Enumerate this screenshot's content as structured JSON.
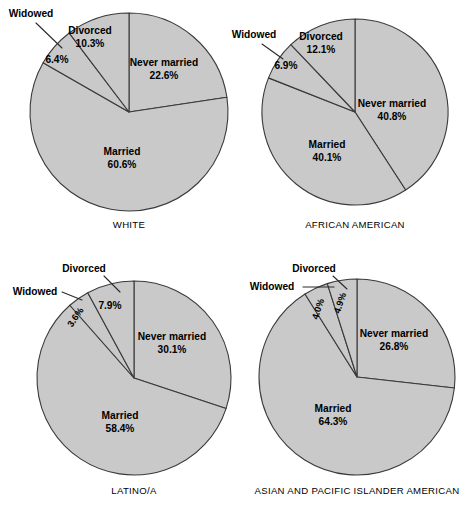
{
  "figure": {
    "background": "#ffffff",
    "slice_fill": "#c9c9c9",
    "slice_stroke": "#3a3a3a",
    "text_color": "#000000"
  },
  "chart_data": [
    {
      "type": "pie",
      "title": "WHITE",
      "categories": [
        "Never married",
        "Married",
        "Widowed",
        "Divorced"
      ],
      "values": [
        22.6,
        60.6,
        6.4,
        10.3
      ],
      "labels": [
        "22.6%",
        "60.6%",
        "6.4%",
        "10.3%"
      ],
      "start_angle_deg": 0,
      "direction": "clockwise",
      "legend": "none",
      "grid": false
    },
    {
      "type": "pie",
      "title": "AFRICAN AMERICAN",
      "categories": [
        "Never married",
        "Married",
        "Widowed",
        "Divorced"
      ],
      "values": [
        40.8,
        40.1,
        6.9,
        12.1
      ],
      "labels": [
        "40.8%",
        "40.1%",
        "6.9%",
        "12.1%"
      ],
      "start_angle_deg": 0,
      "direction": "clockwise",
      "legend": "none",
      "grid": false
    },
    {
      "type": "pie",
      "title": "LATINO/A",
      "categories": [
        "Never married",
        "Married",
        "Widowed",
        "Divorced"
      ],
      "values": [
        30.1,
        58.4,
        3.6,
        7.9
      ],
      "labels": [
        "30.1%",
        "58.4%",
        "3.6%",
        "7.9%"
      ],
      "start_angle_deg": 0,
      "direction": "clockwise",
      "legend": "none",
      "grid": false
    },
    {
      "type": "pie",
      "title": "ASIAN AND PACIFIC ISLANDER AMERICAN",
      "categories": [
        "Never married",
        "Married",
        "Widowed",
        "Divorced"
      ],
      "values": [
        26.8,
        64.3,
        4.0,
        4.9
      ],
      "labels": [
        "26.8%",
        "64.3%",
        "4.0%",
        "4.9%"
      ],
      "start_angle_deg": 0,
      "direction": "clockwise",
      "legend": "none",
      "grid": false
    }
  ],
  "charts": [
    {
      "id": "white",
      "caption": "WHITE",
      "geometry": {
        "cx": 129,
        "cy": 112,
        "r": 99,
        "caption_y": 228
      },
      "slices": [
        {
          "name": "never-married",
          "value": 22.6
        },
        {
          "name": "married",
          "value": 60.6
        },
        {
          "name": "widowed",
          "value": 6.4
        },
        {
          "name": "divorced",
          "value": 10.3
        }
      ],
      "annotations": [
        {
          "name": "never-married-label",
          "line1": "Never married",
          "line2": "22.6%",
          "x": 164,
          "y": 66,
          "anchor": "middle",
          "rotate": 0,
          "size": "lbl"
        },
        {
          "name": "married-label",
          "line1": "Married",
          "line2": "60.6%",
          "x": 122,
          "y": 155,
          "anchor": "middle",
          "rotate": 0,
          "size": "lbl"
        },
        {
          "name": "divorced-label",
          "line1": "Divorced",
          "line2": "10.3%",
          "x": 90,
          "y": 34,
          "anchor": "middle",
          "rotate": 0,
          "size": "lbl"
        },
        {
          "name": "widowed-percent-label",
          "line1": "6.4%",
          "line2": "",
          "x": 57,
          "y": 63,
          "anchor": "middle",
          "rotate": 0,
          "size": "lbl"
        },
        {
          "name": "widowed-label",
          "line1": "Widowed",
          "line2": "",
          "x": 31,
          "y": 17,
          "anchor": "middle",
          "rotate": 0,
          "size": "lbl"
        }
      ],
      "leaders": [
        {
          "name": "widowed-leader",
          "d": "M 36 23 L 62 48"
        }
      ]
    },
    {
      "id": "african-american",
      "caption": "AFRICAN AMERICAN",
      "geometry": {
        "cx": 355,
        "cy": 112,
        "r": 93,
        "caption_y": 228
      },
      "slices": [
        {
          "name": "never-married",
          "value": 40.8
        },
        {
          "name": "married",
          "value": 40.1
        },
        {
          "name": "widowed",
          "value": 6.9
        },
        {
          "name": "divorced",
          "value": 12.1
        }
      ],
      "annotations": [
        {
          "name": "never-married-label",
          "line1": "Never married",
          "line2": "40.8%",
          "x": 392,
          "y": 107,
          "anchor": "middle",
          "rotate": 0,
          "size": "lbl"
        },
        {
          "name": "married-label",
          "line1": "Married",
          "line2": "40.1%",
          "x": 327,
          "y": 148,
          "anchor": "middle",
          "rotate": 0,
          "size": "lbl"
        },
        {
          "name": "divorced-label",
          "line1": "Divorced",
          "line2": "12.1%",
          "x": 321,
          "y": 40,
          "anchor": "middle",
          "rotate": 0,
          "size": "lbl"
        },
        {
          "name": "widowed-percent-label",
          "line1": "6.9%",
          "line2": "",
          "x": 286,
          "y": 69,
          "anchor": "middle",
          "rotate": 0,
          "size": "lbl"
        },
        {
          "name": "widowed-label",
          "line1": "Widowed",
          "line2": "",
          "x": 254,
          "y": 38,
          "anchor": "middle",
          "rotate": 0,
          "size": "lbl"
        }
      ],
      "leaders": [
        {
          "name": "widowed-leader",
          "d": "M 262 44 L 283 59"
        }
      ]
    },
    {
      "id": "latino",
      "caption": "LATINO/A",
      "geometry": {
        "cx": 134,
        "cy": 378,
        "r": 97,
        "caption_y": 494
      },
      "slices": [
        {
          "name": "never-married",
          "value": 30.1
        },
        {
          "name": "married",
          "value": 58.4
        },
        {
          "name": "widowed",
          "value": 3.6
        },
        {
          "name": "divorced",
          "value": 7.9
        }
      ],
      "annotations": [
        {
          "name": "never-married-label",
          "line1": "Never married",
          "line2": "30.1%",
          "x": 172,
          "y": 340,
          "anchor": "middle",
          "rotate": 0,
          "size": "lbl"
        },
        {
          "name": "married-label",
          "line1": "Married",
          "line2": "58.4%",
          "x": 120,
          "y": 419,
          "anchor": "middle",
          "rotate": 0,
          "size": "lbl"
        },
        {
          "name": "divorced-percent-label",
          "line1": "7.9%",
          "line2": "",
          "x": 110,
          "y": 309,
          "anchor": "middle",
          "rotate": 0,
          "size": "lbl"
        },
        {
          "name": "divorced-label",
          "line1": "Divorced",
          "line2": "",
          "x": 84,
          "y": 272,
          "anchor": "middle",
          "rotate": 0,
          "size": "lbl"
        },
        {
          "name": "widowed-percent-label",
          "line1": "3.6%",
          "line2": "",
          "x": 78,
          "y": 319,
          "anchor": "middle",
          "rotate": -55,
          "size": "lbl-small"
        },
        {
          "name": "widowed-label",
          "line1": "Widowed",
          "line2": "",
          "x": 35,
          "y": 295,
          "anchor": "middle",
          "rotate": 0,
          "size": "lbl"
        }
      ],
      "leaders": [
        {
          "name": "divorced-leader",
          "d": "M 104 276 L 120 292"
        },
        {
          "name": "widowed-leader",
          "d": "M 62 292 L 82 300"
        }
      ]
    },
    {
      "id": "asian-pacific-islander",
      "caption": "ASIAN AND PACIFIC ISLANDER AMERICAN",
      "geometry": {
        "cx": 357,
        "cy": 377,
        "r": 98,
        "caption_y": 494
      },
      "slices": [
        {
          "name": "never-married",
          "value": 26.8
        },
        {
          "name": "married",
          "value": 64.3
        },
        {
          "name": "widowed",
          "value": 4.0
        },
        {
          "name": "divorced",
          "value": 4.9
        }
      ],
      "annotations": [
        {
          "name": "never-married-label",
          "line1": "Never married",
          "line2": "26.8%",
          "x": 394,
          "y": 337,
          "anchor": "middle",
          "rotate": 0,
          "size": "lbl"
        },
        {
          "name": "married-label",
          "line1": "Married",
          "line2": "64.3%",
          "x": 333,
          "y": 412,
          "anchor": "middle",
          "rotate": 0,
          "size": "lbl"
        },
        {
          "name": "divorced-percent-label",
          "line1": "4.9%",
          "line2": "",
          "x": 343,
          "y": 304,
          "anchor": "middle",
          "rotate": -72,
          "size": "lbl-small"
        },
        {
          "name": "divorced-label",
          "line1": "Divorced",
          "line2": "",
          "x": 314,
          "y": 272,
          "anchor": "middle",
          "rotate": 0,
          "size": "lbl"
        },
        {
          "name": "widowed-percent-label",
          "line1": "4.0%",
          "line2": "",
          "x": 321,
          "y": 310,
          "anchor": "middle",
          "rotate": -72,
          "size": "lbl-small"
        },
        {
          "name": "widowed-label",
          "line1": "Widowed",
          "line2": "",
          "x": 272,
          "y": 290,
          "anchor": "middle",
          "rotate": 0,
          "size": "lbl"
        }
      ],
      "leaders": [
        {
          "name": "divorced-leader",
          "d": "M 333 276 L 347 289"
        },
        {
          "name": "widowed-leader",
          "d": "M 303 287 L 334 287"
        }
      ]
    }
  ]
}
